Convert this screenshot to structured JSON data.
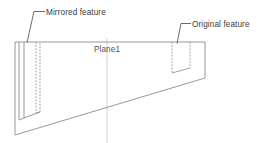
{
  "diagram": {
    "type": "cad-technical-drawing",
    "background_color": "#ffffff",
    "outline_color": "#888888",
    "hidden_line_color": "#8a8a8a",
    "leader_color": "#5a5a5a",
    "plane_line_color": "#e2e2e2",
    "text_color": "#3c3c3c",
    "annotations": [
      {
        "id": "mirrored-feature",
        "label": "Mirrored feature",
        "text_x": 46,
        "text_y": 14,
        "leader": "M 44 11.5 L 34 11.5 L 27 42.5"
      },
      {
        "id": "original-feature",
        "label": "Original feature",
        "text_x": 192,
        "text_y": 26,
        "leader": "M 190 23.5 L 181 23.5 L 176 43.5"
      }
    ],
    "plane": {
      "label": "Plane1",
      "text_x": 107,
      "text_y": 51,
      "line_x": 107,
      "line_top": 38,
      "line_bottom": 143
    },
    "body": {
      "outline_path": "M 15 42 L 205 42 L 205 78 L 15 135 Z",
      "top_y": 42,
      "left_x": 15,
      "right_x": 205,
      "right_bottom_y": 78,
      "left_bottom_y": 135
    },
    "features": [
      {
        "id": "mirrored-slot",
        "side": "left",
        "style": "mixed",
        "near_face_path": "M 23 42 L 23 118 L 40 112",
        "near_edge_vertical_x": 23,
        "hidden_path": "M 36 42 L 36 113",
        "hidden_bottom_path": "M 23 118 L 40 112 L 40 44",
        "front_corner_path": "M 19 42 L 19 120"
      },
      {
        "id": "original-slot",
        "side": "right",
        "style": "hidden",
        "hidden_left_x": 172,
        "hidden_right_x": 190,
        "hidden_top_y": 42,
        "hidden_left_bottom_y": 73,
        "hidden_right_bottom_y": 68,
        "hidden_path_left": "M 172 42 L 172 73",
        "hidden_path_right": "M 190 42 L 190 68",
        "hidden_path_bottom": "M 172 73 L 190 68"
      }
    ]
  }
}
